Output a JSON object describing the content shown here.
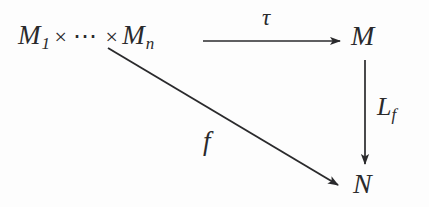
{
  "diagram": {
    "type": "commutative-diagram",
    "shape": "triangle",
    "background_color": "#fdfdfd",
    "ink_color": "#2a2a2c",
    "nodes": [
      {
        "id": "source",
        "label": "M_1 × ⋯ × M_n",
        "base": "M",
        "sub_first": "1",
        "times": "×",
        "dots": "⋯",
        "sub_last": "n",
        "x": 18,
        "y": 22
      },
      {
        "id": "codomain-m",
        "label": "M",
        "x": 351,
        "y": 22
      },
      {
        "id": "codomain-n",
        "label": "N",
        "x": 353,
        "y": 170
      }
    ],
    "arrows": [
      {
        "id": "tau-arrow",
        "label": "τ",
        "from": "source",
        "to": "codomain-m",
        "orientation": "horizontal",
        "label_x": 262,
        "label_y": 6,
        "x1": 203,
        "y1": 41,
        "x2": 344,
        "y2": 41
      },
      {
        "id": "lf-arrow",
        "label": "L",
        "label_sub": "f",
        "label_full": "L_f",
        "from": "codomain-m",
        "to": "codomain-n",
        "orientation": "vertical",
        "label_x": 377,
        "label_y": 94,
        "x1": 365,
        "y1": 60,
        "x2": 365,
        "y2": 168
      },
      {
        "id": "f-arrow",
        "label": "f",
        "from": "source",
        "to": "codomain-n",
        "orientation": "diagonal",
        "label_x": 203,
        "label_y": 128,
        "x1": 108,
        "y1": 48,
        "x2": 343,
        "y2": 188
      }
    ]
  }
}
